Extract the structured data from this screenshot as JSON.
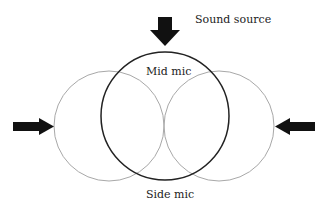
{
  "diagram": {
    "labels": {
      "sound_source": "Sound source",
      "mid_mic": "Mid mic",
      "side_mic": "Side mic"
    },
    "colors": {
      "background": "#ffffff",
      "mid_circle": "#222222",
      "side_circles": "#a8a8a8",
      "arrows": "#111111",
      "text": "#222222"
    },
    "shapes": {
      "mid_circle": {
        "cx": 165,
        "cy": 116,
        "r": 64
      },
      "side_left_circle": {
        "cx": 109,
        "cy": 126,
        "r": 55
      },
      "side_right_circle": {
        "cx": 219,
        "cy": 126,
        "r": 55
      }
    },
    "arrows": [
      {
        "name": "top-arrow",
        "direction": "down"
      },
      {
        "name": "left-arrow",
        "direction": "right"
      },
      {
        "name": "right-arrow",
        "direction": "left"
      }
    ]
  }
}
